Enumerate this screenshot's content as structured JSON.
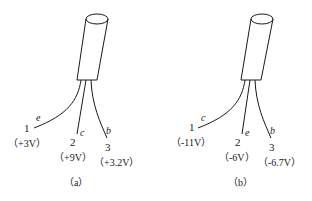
{
  "panels": [
    {
      "caption": "（a）",
      "leads": [
        {
          "number": "1",
          "terminal": "e",
          "voltage": "（+3V）"
        },
        {
          "number": "2",
          "terminal": "c",
          "voltage": "（+9V）"
        },
        {
          "number": "3",
          "terminal": "b",
          "voltage": "（+3.2V）"
        }
      ]
    },
    {
      "caption": "（b）",
      "leads": [
        {
          "number": "1",
          "terminal": "c",
          "voltage": "（-11V）"
        },
        {
          "number": "2",
          "terminal": "e",
          "voltage": "（-6V）"
        },
        {
          "number": "3",
          "terminal": "b",
          "voltage": "（-6.7V）"
        }
      ]
    }
  ]
}
